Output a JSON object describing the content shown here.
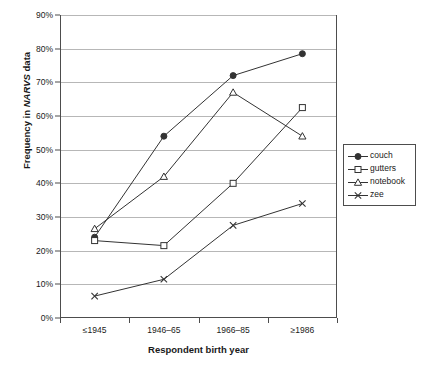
{
  "chart_data": {
    "type": "line",
    "title": "",
    "xlabel": "Respondent birth year",
    "ylabel": "Frequency in NARVS data",
    "ylabel_plain": "Frequency in ",
    "ylabel_italic": "NARVS",
    "ylabel_tail": " data",
    "categories": [
      "≤1945",
      "1946–65",
      "1966–85",
      "≥1986"
    ],
    "ylim": [
      0,
      90
    ],
    "ytick_values": [
      0,
      10,
      20,
      30,
      40,
      50,
      60,
      70,
      80,
      90
    ],
    "ytick_labels": [
      "0%",
      "10%",
      "20%",
      "30%",
      "40%",
      "50%",
      "60%",
      "70%",
      "80%",
      "90%"
    ],
    "grid": "horizontal",
    "legend_position": "right",
    "series": [
      {
        "name": "couch",
        "marker": "filled-circle",
        "values": [
          24.0,
          54.0,
          72.0,
          78.5
        ]
      },
      {
        "name": "gutters",
        "marker": "open-square",
        "values": [
          23.0,
          21.5,
          40.0,
          62.5
        ]
      },
      {
        "name": "notebook",
        "marker": "open-triangle",
        "values": [
          26.5,
          42.0,
          67.0,
          54.0
        ]
      },
      {
        "name": "zee",
        "marker": "cross-x",
        "values": [
          6.5,
          11.5,
          27.5,
          34.0
        ]
      }
    ]
  },
  "legend": {
    "items": [
      {
        "label": "couch"
      },
      {
        "label": "gutters"
      },
      {
        "label": "notebook"
      },
      {
        "label": "zee"
      }
    ]
  },
  "colors": {
    "line": "#333333",
    "grid": "#b7b7b7",
    "axis": "#4d4d4d",
    "text": "#1a1a1a",
    "background": "#ffffff"
  }
}
